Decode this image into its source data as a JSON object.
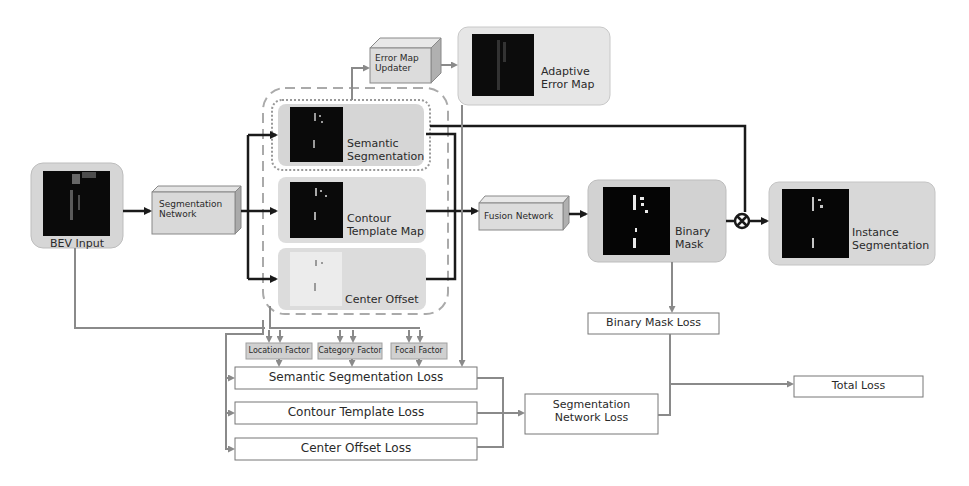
{
  "diagram": {
    "colors": {
      "panel_fill": "#d6d6d6",
      "panel_fill_light": "#e8e8e8",
      "thumbnail": "#0a0a0a",
      "arrow_dark": "#1a1a1a",
      "arrow_gray": "#8a8a8a",
      "box_border": "#777777",
      "factor_fill": "#d0d0d0"
    },
    "nodes": {
      "bev_input": {
        "label": "BEV Input"
      },
      "segmentation_network": {
        "label": "Segmentation Network"
      },
      "error_map_updater": {
        "label": "Error Map Updater"
      },
      "adaptive_error_map": {
        "label": "Adaptive Error Map"
      },
      "semantic_segmentation": {
        "label": "Semantic Segmentation"
      },
      "contour_template_map": {
        "label": "Contour Template Map"
      },
      "center_offset": {
        "label": "Center Offset"
      },
      "fusion_network": {
        "label": "Fusion Network"
      },
      "binary_mask": {
        "label": "Binary Mask"
      },
      "instance_segmentation": {
        "label": "Instance Segmentation"
      },
      "multiply_op": {
        "label": "⊗"
      }
    },
    "factors": [
      {
        "label": "Location Factor"
      },
      {
        "label": "Category Factor"
      },
      {
        "label": "Focal Factor"
      }
    ],
    "losses": {
      "semantic_segmentation_loss": {
        "label": "Semantic Segmentation Loss"
      },
      "contour_template_loss": {
        "label": "Contour Template Loss"
      },
      "center_offset_loss": {
        "label": "Center Offset Loss"
      },
      "segmentation_network_loss": {
        "label": "Segmentation Network Loss"
      },
      "binary_mask_loss": {
        "label": "Binary Mask Loss"
      },
      "total_loss": {
        "label": "Total Loss"
      }
    }
  }
}
